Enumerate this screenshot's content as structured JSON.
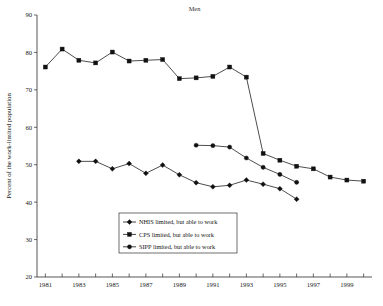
{
  "chart_data": {
    "type": "line",
    "title": "Men",
    "xlabel": "",
    "ylabel": "Percent of the work-limited population",
    "xlim": [
      1980.5,
      2000.5
    ],
    "ylim": [
      20,
      90
    ],
    "yticks": [
      20,
      30,
      40,
      50,
      60,
      70,
      80,
      90
    ],
    "xticks": [
      1981,
      1982,
      1983,
      1984,
      1985,
      1986,
      1987,
      1988,
      1989,
      1990,
      1991,
      1992,
      1993,
      1994,
      1995,
      1996,
      1997,
      1998,
      1999,
      2000
    ],
    "xtick_labels": [
      "1981",
      "",
      "1983",
      "",
      "1985",
      "",
      "1987",
      "",
      "1989",
      "",
      "1991",
      "",
      "1993",
      "",
      "1995",
      "",
      "1997",
      "",
      "1999",
      ""
    ],
    "grid": false,
    "legend_position": "lower-center",
    "series": [
      {
        "name": "NHIS limited, but able to work",
        "marker": "diamond",
        "x": [
          1983,
          1984,
          1985,
          1986,
          1987,
          1988,
          1989,
          1990,
          1991,
          1992,
          1993,
          1994,
          1995,
          1996
        ],
        "values": [
          50.9,
          50.9,
          48.9,
          50.3,
          47.7,
          49.9,
          47.3,
          45.2,
          44.1,
          44.5,
          45.9,
          44.8,
          43.6,
          40.8
        ]
      },
      {
        "name": "CPS limited, but able to work",
        "marker": "square",
        "x": [
          1981,
          1982,
          1983,
          1984,
          1985,
          1986,
          1987,
          1988,
          1989,
          1990,
          1991,
          1992,
          1993,
          1994,
          1995,
          1996,
          1997,
          1998,
          1999,
          2000
        ],
        "values": [
          76.1,
          80.9,
          77.9,
          77.2,
          80.1,
          77.7,
          77.9,
          78.1,
          73.0,
          73.2,
          73.6,
          76.1,
          73.4,
          53.0,
          51.2,
          49.6,
          48.9,
          46.7,
          45.9,
          45.6
        ]
      },
      {
        "name": "SIPP limited, but able to work",
        "marker": "circle",
        "x": [
          1990,
          1991,
          1992,
          1993,
          1994,
          1995,
          1996
        ],
        "values": [
          55.2,
          55.1,
          54.7,
          51.8,
          49.3,
          47.4,
          45.3
        ]
      }
    ]
  },
  "legend": {
    "entries": [
      {
        "label": "NHIS limited, but able to work",
        "marker": "diamond-marker-icon"
      },
      {
        "label": "CPS limited, but able to work",
        "marker": "square-marker-icon"
      },
      {
        "label": "SIPP limited, but able to work",
        "marker": "circle-marker-icon"
      }
    ]
  },
  "colors": {
    "series": "#111111",
    "axis": "#2b2b2b",
    "background": "#ffffff"
  }
}
